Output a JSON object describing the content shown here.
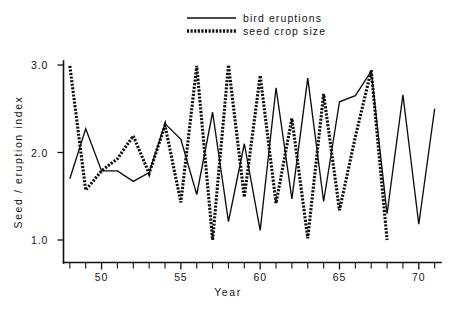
{
  "chart_data": {
    "type": "line",
    "title": "",
    "xlabel": "Year",
    "ylabel": "Seed / eruption index",
    "xlim": [
      47.6,
      71.4
    ],
    "ylim": [
      0.85,
      3.05
    ],
    "grid": false,
    "legend_position": "top-center",
    "x_tick_labels": [
      "50",
      "55",
      "60",
      "65",
      "70"
    ],
    "x_major_ticks": [
      50,
      55,
      60,
      65,
      70
    ],
    "x_minor_ticks": [
      48,
      49,
      51,
      52,
      53,
      54,
      56,
      57,
      58,
      59,
      61,
      62,
      63,
      64,
      66,
      67,
      68,
      69,
      71
    ],
    "y_tick_labels": [
      "1.0",
      "2.0",
      "3.0"
    ],
    "y_ticks": [
      1.0,
      2.0,
      3.0
    ],
    "series": [
      {
        "name": "bird eruptions",
        "style": "solid",
        "color": "#0d0d0d",
        "x": [
          48,
          49,
          50,
          51,
          52,
          53,
          54,
          55,
          56,
          57,
          58,
          59,
          60,
          61,
          62,
          63,
          64,
          65,
          66,
          67,
          68,
          69,
          70,
          71
        ],
        "values": [
          1.7,
          2.27,
          1.79,
          1.79,
          1.67,
          1.77,
          2.33,
          2.15,
          1.52,
          2.46,
          1.21,
          2.1,
          1.11,
          2.74,
          1.47,
          2.85,
          1.44,
          2.58,
          2.65,
          2.93,
          1.3,
          2.66,
          1.18,
          2.5
        ]
      },
      {
        "name": "seed crop size",
        "style": "dotted",
        "color": "#0d0d0d",
        "x": [
          48,
          49,
          50,
          51,
          52,
          53,
          54,
          55,
          56,
          57,
          58,
          59,
          60,
          61,
          62,
          63,
          64,
          65,
          66,
          67,
          68
        ],
        "values": [
          2.99,
          1.57,
          1.79,
          1.93,
          2.19,
          1.76,
          2.31,
          1.43,
          2.99,
          1.0,
          3.0,
          1.49,
          2.88,
          1.42,
          2.39,
          1.02,
          2.67,
          1.34,
          2.18,
          2.94,
          1.0
        ]
      }
    ]
  },
  "legend": {
    "entries": [
      {
        "label": "bird eruptions",
        "key": "solid-line-key"
      },
      {
        "label": "seed crop size",
        "key": "dotted-line-key"
      }
    ]
  },
  "axes": {
    "x_title": "Year",
    "y_title": "Seed / eruption index"
  }
}
